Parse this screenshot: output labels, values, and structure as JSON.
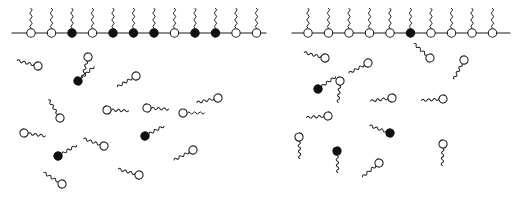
{
  "figure": {
    "background_color": "#ffffff",
    "stroke_color": "#1c1c1c",
    "head_open_fill": "#ffffff",
    "head_filled_fill": "#101010",
    "width": 520,
    "height": 208
  },
  "legend_semantics": {
    "open_circle": "open-head-surfactant",
    "filled_circle": "filled-head-surfactant",
    "wavy_line": "hydrocarbon-tail",
    "horizontal_line": "air-water-interface"
  },
  "panels": [
    {
      "id": "left-panel",
      "name": "mixed-monolayer-panel",
      "interface": {
        "x1": 12,
        "x2": 266,
        "y": 33
      },
      "monolayer": {
        "count": 12,
        "spacing": 20.5,
        "start_x": 31,
        "head_radius": 4.2,
        "tail_height": 20,
        "heads": [
          "open",
          "open",
          "filled",
          "open",
          "filled",
          "filled",
          "filled",
          "open",
          "filled",
          "filled",
          "open",
          "open"
        ],
        "filled_count": 6,
        "open_count": 6
      },
      "free_molecules": [
        {
          "x": 38,
          "y": 66,
          "rot": 195,
          "head": "open",
          "scale": 1.0
        },
        {
          "x": 88,
          "y": 57,
          "rot": 105,
          "head": "open",
          "scale": 1.0
        },
        {
          "x": 78,
          "y": 81,
          "rot": 318,
          "head": "filled",
          "scale": 1.0
        },
        {
          "x": 136,
          "y": 76,
          "rot": 150,
          "head": "open",
          "scale": 1.0
        },
        {
          "x": 24,
          "y": 133,
          "rot": 8,
          "head": "open",
          "scale": 1.0
        },
        {
          "x": 60,
          "y": 118,
          "rot": 238,
          "head": "open",
          "scale": 1.0
        },
        {
          "x": 107,
          "y": 110,
          "rot": 2,
          "head": "open",
          "scale": 1.0
        },
        {
          "x": 147,
          "y": 108,
          "rot": 3,
          "head": "open",
          "scale": 1.0
        },
        {
          "x": 183,
          "y": 113,
          "rot": 0,
          "head": "open",
          "scale": 1.0
        },
        {
          "x": 218,
          "y": 98,
          "rot": 168,
          "head": "open",
          "scale": 1.0
        },
        {
          "x": 145,
          "y": 136,
          "rot": 332,
          "head": "filled",
          "scale": 1.0
        },
        {
          "x": 104,
          "y": 146,
          "rot": 200,
          "head": "open",
          "scale": 1.0
        },
        {
          "x": 193,
          "y": 150,
          "rot": 152,
          "head": "open",
          "scale": 1.0
        },
        {
          "x": 58,
          "y": 156,
          "rot": 330,
          "head": "filled",
          "scale": 1.0
        },
        {
          "x": 62,
          "y": 184,
          "rot": 212,
          "head": "open",
          "scale": 1.0
        },
        {
          "x": 139,
          "y": 175,
          "rot": 196,
          "head": "open",
          "scale": 1.0
        }
      ]
    },
    {
      "id": "right-panel",
      "name": "pure-monolayer-panel",
      "interface": {
        "x1": 292,
        "x2": 510,
        "y": 33
      },
      "monolayer": {
        "count": 10,
        "spacing": 20.5,
        "start_x": 308,
        "head_radius": 4.2,
        "tail_height": 20,
        "heads": [
          "open",
          "open",
          "open",
          "open",
          "open",
          "filled",
          "open",
          "open",
          "open",
          "open"
        ],
        "filled_count": 1,
        "open_count": 9
      },
      "free_molecules": [
        {
          "x": 325,
          "y": 58,
          "rot": 195,
          "head": "open",
          "scale": 1.0
        },
        {
          "x": 340,
          "y": 81,
          "rot": 95,
          "head": "open",
          "scale": 1.0
        },
        {
          "x": 368,
          "y": 63,
          "rot": 152,
          "head": "open",
          "scale": 1.0
        },
        {
          "x": 430,
          "y": 58,
          "rot": 222,
          "head": "open",
          "scale": 1.0
        },
        {
          "x": 464,
          "y": 60,
          "rot": 118,
          "head": "open",
          "scale": 1.0
        },
        {
          "x": 318,
          "y": 89,
          "rot": 325,
          "head": "filled",
          "scale": 1.0
        },
        {
          "x": 392,
          "y": 98,
          "rot": 172,
          "head": "open",
          "scale": 1.0
        },
        {
          "x": 443,
          "y": 99,
          "rot": 176,
          "head": "open",
          "scale": 1.0
        },
        {
          "x": 328,
          "y": 116,
          "rot": 176,
          "head": "open",
          "scale": 1.0
        },
        {
          "x": 299,
          "y": 137,
          "rot": 88,
          "head": "open",
          "scale": 1.0
        },
        {
          "x": 390,
          "y": 133,
          "rot": 200,
          "head": "filled",
          "scale": 1.0
        },
        {
          "x": 443,
          "y": 144,
          "rot": 92,
          "head": "open",
          "scale": 1.0
        },
        {
          "x": 337,
          "y": 151,
          "rot": 88,
          "head": "filled",
          "scale": 1.0
        },
        {
          "x": 379,
          "y": 163,
          "rot": 140,
          "head": "open",
          "scale": 1.0
        }
      ]
    }
  ]
}
